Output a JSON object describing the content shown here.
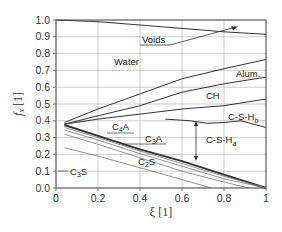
{
  "chart_data": {
    "type": "area",
    "title": "",
    "xlabel": "ξ [1]",
    "ylabel": "f_x [1]",
    "xlim": [
      0,
      1
    ],
    "ylim": [
      0,
      1
    ],
    "x_ticks": [
      "0",
      "0.2",
      "0.4",
      "0.6",
      "0.8",
      "1"
    ],
    "y_ticks": [
      "0.0",
      "0.1",
      "0.2",
      "0.3",
      "0.4",
      "0.5",
      "0.6",
      "0.7",
      "0.8",
      "0.9",
      "1.0"
    ],
    "grid": true,
    "legend": "none (phase regions labeled inline)",
    "series": [
      {
        "name": "Voids/Water boundary",
        "weight": "normal",
        "points": [
          [
            0,
            1.0
          ],
          [
            0.2,
            0.99
          ],
          [
            0.4,
            0.97
          ],
          [
            0.6,
            0.95
          ],
          [
            0.8,
            0.93
          ],
          [
            1.0,
            0.915
          ]
        ]
      },
      {
        "name": "Water/Alum. boundary",
        "weight": "normal",
        "points": [
          [
            0.04,
            0.39
          ],
          [
            0.2,
            0.47
          ],
          [
            0.4,
            0.56
          ],
          [
            0.6,
            0.65
          ],
          [
            0.8,
            0.71
          ],
          [
            1.0,
            0.765
          ]
        ]
      },
      {
        "name": "Alum./CH boundary",
        "weight": "normal",
        "points": [
          [
            0.04,
            0.38
          ],
          [
            0.2,
            0.43
          ],
          [
            0.4,
            0.49
          ],
          [
            0.6,
            0.57
          ],
          [
            0.8,
            0.62
          ],
          [
            1.0,
            0.66
          ]
        ]
      },
      {
        "name": "CH/C-S-Hb boundary",
        "weight": "normal",
        "points": [
          [
            0.04,
            0.38
          ],
          [
            0.2,
            0.41
          ],
          [
            0.4,
            0.44
          ],
          [
            0.6,
            0.47
          ],
          [
            0.8,
            0.49
          ],
          [
            1.0,
            0.53
          ]
        ]
      },
      {
        "name": "C-S-Hb/C-S-Ha boundary",
        "weight": "normal",
        "points": [
          [
            0.52,
            0.41
          ],
          [
            0.64,
            0.4
          ],
          [
            0.72,
            0.385
          ],
          [
            0.8,
            0.39
          ],
          [
            0.88,
            0.4
          ],
          [
            1.0,
            0.36
          ]
        ]
      },
      {
        "name": "C4A/C-S-Ha (bold)",
        "weight": "bold",
        "points": [
          [
            0.04,
            0.375
          ],
          [
            0.2,
            0.31
          ],
          [
            0.4,
            0.23
          ],
          [
            0.6,
            0.16
          ],
          [
            0.8,
            0.08
          ],
          [
            1.0,
            0.0
          ]
        ]
      },
      {
        "name": "C3A/C2S boundary",
        "weight": "light",
        "points": [
          [
            0.04,
            0.36
          ],
          [
            0.2,
            0.3
          ],
          [
            0.4,
            0.22
          ],
          [
            0.6,
            0.145
          ],
          [
            0.8,
            0.07
          ],
          [
            1.0,
            0.0
          ]
        ]
      },
      {
        "name": "C2S upper",
        "weight": "light",
        "points": [
          [
            0.04,
            0.345
          ],
          [
            0.2,
            0.285
          ],
          [
            0.4,
            0.205
          ],
          [
            0.6,
            0.13
          ],
          [
            0.8,
            0.055
          ],
          [
            1.0,
            0.0
          ]
        ]
      },
      {
        "name": "C2S/C3S boundary",
        "weight": "light",
        "points": [
          [
            0.04,
            0.32
          ],
          [
            0.2,
            0.26
          ],
          [
            0.4,
            0.18
          ],
          [
            0.6,
            0.1
          ],
          [
            0.8,
            0.035
          ],
          [
            0.92,
            0.0
          ]
        ]
      },
      {
        "name": "C3S lower",
        "weight": "light",
        "points": [
          [
            0.04,
            0.24
          ],
          [
            0.2,
            0.19
          ],
          [
            0.4,
            0.12
          ],
          [
            0.6,
            0.05
          ],
          [
            0.74,
            0.0
          ]
        ]
      }
    ],
    "annotations": [
      {
        "text": "Voids",
        "x": 0.42,
        "y": 0.885,
        "arrow_to": [
          0.78,
          0.95
        ]
      },
      {
        "text": "Water",
        "x": 0.3,
        "y": 0.74
      },
      {
        "text": "Alum.",
        "x": 0.88,
        "y": 0.66
      },
      {
        "text": "CH",
        "x": 0.52,
        "y": 0.53
      },
      {
        "text": "C-S-Hb",
        "x": 0.91,
        "y": 0.43
      },
      {
        "text": "C-S-Ha",
        "x": 0.7,
        "y": 0.305,
        "double_arrow": [
          [
            0.6,
            0.4
          ],
          [
            0.6,
            0.16
          ]
        ]
      },
      {
        "text": "C4A",
        "x": 0.23,
        "y": 0.345
      },
      {
        "text": "C3A",
        "x": 0.42,
        "y": 0.3
      },
      {
        "text": "C2S",
        "x": 0.4,
        "y": 0.17
      },
      {
        "text": "C3S",
        "x": 0.07,
        "y": 0.095
      }
    ]
  },
  "labels": {
    "xlabel": "ξ [1]",
    "ylabel_main": "f",
    "ylabel_sub": "x",
    "ylabel_unit": " [1]",
    "voids": "Voids",
    "water": "Water",
    "alum": "Alum.",
    "ch": "CH",
    "csh_b": "C-S-H",
    "csh_b_sub": "b",
    "csh_a": "C-S-H",
    "csh_a_sub": "a",
    "c4a_c": "C",
    "c4a_n": "4",
    "c4a_a": "A",
    "c3a_c": "C",
    "c3a_n": "3",
    "c3a_a": "A",
    "c2s_c": "C",
    "c2s_n": "2",
    "c2s_s": "S",
    "c3s_c": "C",
    "c3s_n": "3",
    "c3s_s": "S"
  },
  "colors": {
    "line": "#333333",
    "grid": "#aaaaaa",
    "light_line": "#777777",
    "axis": "#555555"
  }
}
